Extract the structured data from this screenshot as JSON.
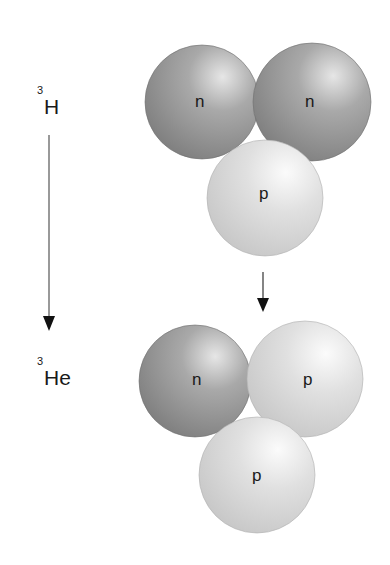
{
  "diagram": {
    "title": "",
    "nuclei": [
      {
        "label_mass": "3",
        "label_symbol": "H",
        "particles": [
          {
            "type": "n",
            "label": "n",
            "color": "#8c8c8c"
          },
          {
            "type": "n",
            "label": "n",
            "color": "#8c8c8c"
          },
          {
            "type": "p",
            "label": "p",
            "color": "#d6d6d6"
          }
        ]
      },
      {
        "label_mass": "3",
        "label_symbol": "He",
        "particles": [
          {
            "type": "n",
            "label": "n",
            "color": "#8c8c8c"
          },
          {
            "type": "p",
            "label": "p",
            "color": "#d6d6d6"
          },
          {
            "type": "p",
            "label": "p",
            "color": "#d6d6d6"
          }
        ]
      }
    ],
    "arrows": [
      {
        "name": "decay-arrow-left",
        "direction": "down"
      },
      {
        "name": "decay-arrow-center",
        "direction": "down"
      }
    ]
  }
}
